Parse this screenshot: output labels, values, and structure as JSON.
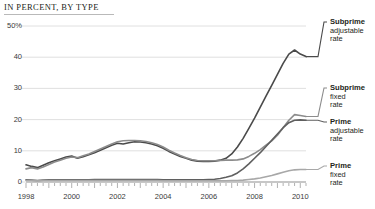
{
  "header": {
    "kicker": "IN PERCENT, BY TYPE"
  },
  "axis": {
    "y_ticks": [
      "50%",
      "40",
      "30",
      "20",
      "10",
      "0"
    ],
    "x_ticks": [
      "1998",
      "2000",
      "2002",
      "2004",
      "2006",
      "2008",
      "2010"
    ]
  },
  "legend": [
    {
      "title": "Subprime",
      "line1": "adjustable",
      "line2": "rate",
      "color": "#4a4a4a"
    },
    {
      "title": "Subprime",
      "line1": "fixed",
      "line2": "rate",
      "color": "#8c8c8c"
    },
    {
      "title": "Prime",
      "line1": "adjustable",
      "line2": "rate",
      "color": "#5f5f5f"
    },
    {
      "title": "Prime",
      "line1": "fixed",
      "line2": "rate",
      "color": "#a8a8a8"
    }
  ],
  "chart_data": {
    "type": "line",
    "title": "IN PERCENT, BY TYPE",
    "xlabel": "",
    "ylabel": "Percent",
    "ylim": [
      0,
      50
    ],
    "xlim": [
      1998,
      2010.25
    ],
    "grid": true,
    "legend_position": "right",
    "ytick_values": [
      0,
      10,
      20,
      30,
      40,
      50
    ],
    "xtick_values": [
      1998,
      2000,
      2002,
      2004,
      2006,
      2008,
      2010
    ],
    "x": [
      1998,
      1998.25,
      1998.5,
      1998.75,
      1999,
      1999.25,
      1999.5,
      1999.75,
      2000,
      2000.25,
      2000.5,
      2000.75,
      2001,
      2001.25,
      2001.5,
      2001.75,
      2002,
      2002.25,
      2002.5,
      2002.75,
      2003,
      2003.25,
      2003.5,
      2003.75,
      2004,
      2004.25,
      2004.5,
      2004.75,
      2005,
      2005.25,
      2005.5,
      2005.75,
      2006,
      2006.25,
      2006.5,
      2006.75,
      2007,
      2007.25,
      2007.5,
      2007.75,
      2008,
      2008.25,
      2008.5,
      2008.75,
      2009,
      2009.25,
      2009.5,
      2009.75,
      2010,
      2010.25
    ],
    "series": [
      {
        "name": "Subprime adjustable rate",
        "color": "#4a4a4a",
        "values": [
          5.5,
          5.0,
          4.6,
          5.4,
          6.2,
          6.8,
          7.4,
          8.0,
          8.3,
          7.6,
          8.1,
          8.7,
          9.4,
          10.2,
          11.0,
          11.8,
          12.4,
          12.2,
          12.6,
          12.9,
          12.8,
          12.6,
          12.2,
          11.6,
          10.8,
          9.8,
          9.0,
          8.2,
          7.6,
          7.0,
          6.7,
          6.6,
          6.6,
          6.7,
          7.0,
          7.6,
          9.0,
          11.2,
          14.0,
          17.2,
          20.5,
          24.0,
          27.5,
          31.0,
          34.5,
          38.0,
          41.0,
          42.3,
          41.0,
          40.2
        ]
      },
      {
        "name": "Subprime fixed rate",
        "color": "#8c8c8c",
        "values": [
          4.2,
          4.6,
          4.2,
          4.8,
          5.6,
          6.4,
          7.0,
          7.6,
          8.0,
          7.8,
          8.4,
          9.0,
          9.8,
          10.6,
          11.4,
          12.2,
          12.9,
          13.2,
          13.3,
          13.3,
          13.2,
          13.0,
          12.6,
          12.0,
          11.2,
          10.2,
          9.3,
          8.5,
          7.8,
          7.2,
          6.9,
          6.8,
          6.8,
          6.8,
          6.9,
          7.0,
          7.0,
          7.1,
          7.4,
          8.2,
          9.2,
          10.4,
          11.8,
          13.2,
          15.0,
          17.4,
          19.8,
          21.6,
          21.3,
          21.0
        ]
      },
      {
        "name": "Prime adjustable rate",
        "color": "#5f5f5f",
        "values": [
          0.7,
          0.6,
          0.5,
          0.6,
          0.7,
          0.7,
          0.7,
          0.7,
          0.7,
          0.7,
          0.7,
          0.7,
          0.8,
          0.8,
          0.8,
          0.8,
          0.8,
          0.8,
          0.8,
          0.8,
          0.8,
          0.8,
          0.8,
          0.8,
          0.7,
          0.7,
          0.7,
          0.7,
          0.7,
          0.7,
          0.7,
          0.7,
          0.8,
          0.9,
          1.1,
          1.5,
          2.0,
          2.9,
          4.2,
          5.8,
          7.6,
          9.4,
          11.4,
          13.4,
          15.4,
          17.4,
          19.0,
          19.8,
          19.9,
          19.8
        ]
      },
      {
        "name": "Prime fixed rate",
        "color": "#a8a8a8",
        "values": [
          0.5,
          0.5,
          0.4,
          0.5,
          0.5,
          0.5,
          0.5,
          0.5,
          0.5,
          0.5,
          0.5,
          0.5,
          0.5,
          0.5,
          0.5,
          0.5,
          0.5,
          0.5,
          0.5,
          0.5,
          0.5,
          0.5,
          0.5,
          0.5,
          0.4,
          0.4,
          0.4,
          0.4,
          0.4,
          0.4,
          0.4,
          0.4,
          0.4,
          0.4,
          0.4,
          0.4,
          0.5,
          0.5,
          0.6,
          0.8,
          1.0,
          1.3,
          1.7,
          2.1,
          2.6,
          3.1,
          3.6,
          3.9,
          4.0,
          4.0
        ]
      }
    ]
  }
}
